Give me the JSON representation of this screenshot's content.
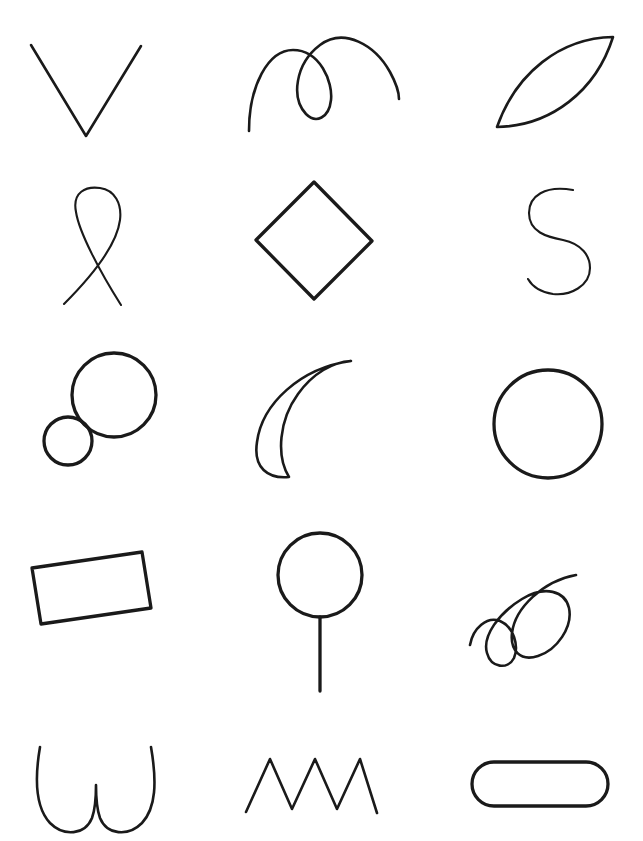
{
  "page": {
    "background_color": "#ffffff",
    "stroke_color": "#1a1a1a",
    "width": 643,
    "height": 841,
    "columns": 3,
    "rows": 5,
    "clipped_header_fragment_left": "·",
    "clipped_header_fragment_right": "·"
  },
  "shapes": [
    {
      "index": 1,
      "row": 1,
      "column": 1,
      "name": "vee-chevron",
      "label": "V chevron",
      "description": "Open V shape with two straight strokes meeting at a bottom vertex",
      "closed": false,
      "stroke_weight": "mid",
      "bbox": [
        30,
        44,
        112,
        94
      ],
      "path": "M 31 45 L 86 136 L 141 46"
    },
    {
      "index": 2,
      "row": 1,
      "column": 2,
      "name": "looping-arc-curve",
      "label": "Looping double arc",
      "description": "Curve rising from lower left into a hump, forming a closed loop, then arcing over to the right",
      "closed": false,
      "stroke_weight": "mid",
      "bbox": [
        247,
        35,
        155,
        97
      ],
      "path": "M 249 131 C 249 86 268 50 293 50 C 320 50 333 82 331 100 C 329 118 316 124 306 114 C 291 98 295 64 320 45 C 344 27 375 45 390 72 C 396 83 399 92 399 99"
    },
    {
      "index": 3,
      "row": 1,
      "column": 3,
      "name": "leaf-lens-shape",
      "label": "Leaf / lens",
      "description": "Pointed oval (vesica) tilted up to the right, two arcs meeting at opposite tips",
      "closed": true,
      "stroke_weight": "mid",
      "bbox": [
        495,
        35,
        120,
        93
      ],
      "path": "M 497 127 C 516 73 560 38 613 37 C 596 91 551 126 497 127 Z"
    },
    {
      "index": 4,
      "row": 2,
      "column": 1,
      "name": "ribbon-loop-crossing",
      "label": "Ribbon loop",
      "description": "Tall teardrop loop at the top whose two tails cross and splay apart downward",
      "closed": false,
      "stroke_weight": "thin",
      "bbox": [
        62,
        186,
        78,
        120
      ],
      "path": "M 121 305 C 100 272 79 232 76 212 C 72 192 86 186 100 188 C 115 190 122 204 120 220 C 117 244 92 276 64 304"
    },
    {
      "index": 5,
      "row": 2,
      "column": 2,
      "name": "diamond-rhombus",
      "label": "Diamond",
      "description": "Four-sided diamond standing on a point",
      "closed": true,
      "stroke_weight": "thick",
      "bbox": [
        255,
        181,
        118,
        118
      ],
      "path": "M 314 182 L 372 241 L 314 299 L 256 240 Z"
    },
    {
      "index": 6,
      "row": 2,
      "column": 3,
      "name": "s-curve-letter",
      "label": "S curve",
      "description": "Letter-S style double curve open at both ends",
      "closed": false,
      "stroke_weight": "thin",
      "bbox": [
        527,
        188,
        64,
        108
      ],
      "path": "M 573 190 C 545 185 529 196 529 213 C 529 232 547 237 563 240 C 582 244 590 256 590 268 C 590 286 570 296 553 294 C 540 292 532 286 528 279"
    },
    {
      "index": 7,
      "row": 3,
      "column": 1,
      "name": "two-tangent-circles",
      "label": "Two tangent circles",
      "description": "Large circle with a smaller circle touching it at the lower left",
      "closed": true,
      "stroke_weight": "thick",
      "bbox": [
        44,
        353,
        113,
        113
      ],
      "circles": [
        {
          "cx": 114,
          "cy": 395,
          "r": 42
        },
        {
          "cx": 68,
          "cy": 441,
          "r": 24
        }
      ]
    },
    {
      "index": 8,
      "row": 3,
      "column": 2,
      "name": "crescent-moon",
      "label": "Crescent moon",
      "description": "Crescent with the horns pointing up-right and down",
      "closed": true,
      "stroke_weight": "mid",
      "bbox": [
        254,
        357,
        100,
        122
      ],
      "path": "M 351 361 C 300 368 262 404 257 442 C 253 468 268 479 289 477 C 276 456 279 420 298 394 C 313 373 333 362 351 361 Z"
    },
    {
      "index": 9,
      "row": 3,
      "column": 3,
      "name": "plain-circle",
      "label": "Circle",
      "description": "Single large circle",
      "closed": true,
      "stroke_weight": "thick",
      "bbox": [
        494,
        370,
        108,
        108
      ],
      "circles": [
        {
          "cx": 548,
          "cy": 424,
          "r": 54
        }
      ]
    },
    {
      "index": 10,
      "row": 4,
      "column": 1,
      "name": "tilted-rectangle",
      "label": "Tilted rectangle",
      "description": "Wide rectangle rotated slightly clockwise",
      "closed": true,
      "stroke_weight": "thick",
      "bbox": [
        31,
        551,
        120,
        74
      ],
      "path": "M 32 568 L 142 552 L 151 608 L 41 624 Z"
    },
    {
      "index": 11,
      "row": 4,
      "column": 2,
      "name": "lollipop-balloon",
      "label": "Lollipop",
      "description": "Circle with a straight vertical stem hanging below it",
      "closed": false,
      "stroke_weight": "thick",
      "bbox": [
        278,
        533,
        84,
        158
      ],
      "circles": [
        {
          "cx": 320,
          "cy": 575,
          "r": 42
        }
      ],
      "path": "M 320 617 L 320 691"
    },
    {
      "index": 12,
      "row": 4,
      "column": 3,
      "name": "double-loop-scroll",
      "label": "Double loop scroll",
      "description": "Cursive ribbon making two overlapping loops, rising to the upper right",
      "closed": false,
      "stroke_weight": "mid",
      "bbox": [
        468,
        573,
        110,
        92
      ],
      "path": "M 470 645 C 473 628 487 616 500 621 C 514 627 519 646 514 658 C 508 670 491 668 487 653 C 482 636 499 613 522 599 C 545 585 565 591 569 608 C 573 627 557 650 538 656 C 520 662 510 650 512 633 C 515 608 543 581 576 575"
    },
    {
      "index": 13,
      "row": 5,
      "column": 1,
      "name": "double-u-outline",
      "label": "Double U",
      "description": "Two rounded U strokes meeting at a narrow central peak",
      "closed": false,
      "stroke_weight": "mid",
      "bbox": [
        38,
        745,
        104,
        90
      ],
      "path": "M 40 747 C 34 782 36 808 50 823 C 64 837 85 835 92 818 C 96 807 96 794 96 785 C 96 794 96 807 100 818 C 107 835 128 837 142 823 C 156 808 157 782 151 747"
    },
    {
      "index": 14,
      "row": 5,
      "column": 2,
      "name": "zigzag-three-peaks",
      "label": "Zigzag",
      "description": "Sharp zigzag line with three upward peaks",
      "closed": false,
      "stroke_weight": "mid",
      "bbox": [
        245,
        758,
        133,
        56
      ],
      "path": "M 246 812 L 270 759 L 292 809 L 315 759 L 337 809 L 360 759 L 377 813"
    },
    {
      "index": 15,
      "row": 5,
      "column": 3,
      "name": "rounded-pill-rectangle",
      "label": "Rounded pill",
      "description": "Horizontal stadium / pill shaped rounded rectangle",
      "closed": true,
      "stroke_weight": "thick",
      "bbox": [
        471,
        761,
        138,
        46
      ],
      "rounded_rect": {
        "x": 472,
        "y": 762,
        "width": 136,
        "height": 44,
        "rx": 22
      }
    }
  ]
}
